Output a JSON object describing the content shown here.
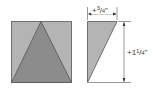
{
  "diagram": {
    "left_figure": {
      "description": "square with isosceles triangle inscribed",
      "square_color": "#b4b4b4",
      "triangle_color": "#8c8c8c",
      "stroke_color": "#555555"
    },
    "right_figure": {
      "description": "right triangle cut piece",
      "fill_color": "#b4b4b4",
      "stroke_color": "#555555"
    },
    "dimensions": {
      "width_label": "+3/4\"",
      "width_prefix": "+",
      "width_num": "3",
      "width_den": "4",
      "height_label": "+1 1/4\"",
      "height_prefix": "+1",
      "height_num": "1",
      "height_den": "4",
      "inch_mark": "\""
    }
  }
}
